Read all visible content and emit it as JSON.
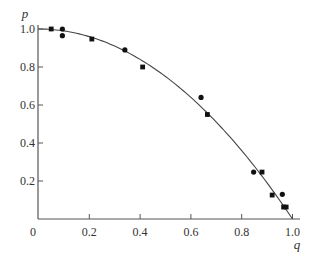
{
  "chart_data": {
    "type": "scatter",
    "title": "",
    "xlabel": "q",
    "ylabel": "p",
    "xlim": [
      0,
      1.0
    ],
    "ylim": [
      0,
      1.0
    ],
    "grid": false,
    "legend": null,
    "x_ticks": [
      {
        "value": 0,
        "label": "0"
      },
      {
        "value": 0.2,
        "label": "0.2"
      },
      {
        "value": 0.4,
        "label": "0.4"
      },
      {
        "value": 0.6,
        "label": "0.6"
      },
      {
        "value": 0.8,
        "label": "0.8"
      },
      {
        "value": 1.0,
        "label": "1.0"
      }
    ],
    "y_ticks": [
      {
        "value": 0.2,
        "label": "0.2"
      },
      {
        "value": 0.4,
        "label": "0.4"
      },
      {
        "value": 0.6,
        "label": "0.6"
      },
      {
        "value": 0.8,
        "label": "0.8"
      },
      {
        "value": 1.0,
        "label": "1.0"
      }
    ],
    "series": [
      {
        "name": "circles",
        "marker": "circle",
        "points": [
          {
            "x": 0.094,
            "y": 1.0
          },
          {
            "x": 0.094,
            "y": 0.965
          },
          {
            "x": 0.34,
            "y": 0.89
          },
          {
            "x": 0.64,
            "y": 0.64
          },
          {
            "x": 0.847,
            "y": 0.247
          },
          {
            "x": 0.96,
            "y": 0.13
          }
        ]
      },
      {
        "name": "squares",
        "marker": "square",
        "points": [
          {
            "x": 0.05,
            "y": 1.0
          },
          {
            "x": 0.21,
            "y": 0.947
          },
          {
            "x": 0.41,
            "y": 0.8
          },
          {
            "x": 0.665,
            "y": 0.55
          },
          {
            "x": 0.88,
            "y": 0.247
          },
          {
            "x": 0.92,
            "y": 0.126
          },
          {
            "x": 0.965,
            "y": 0.063
          },
          {
            "x": 0.975,
            "y": 0.063
          }
        ]
      },
      {
        "name": "fit curve",
        "type": "line",
        "equation": "p = 1 - q^2",
        "x": [
          0,
          0.1,
          0.2,
          0.3,
          0.4,
          0.5,
          0.6,
          0.7,
          0.8,
          0.9,
          1.0
        ],
        "y": [
          1.0,
          0.99,
          0.96,
          0.91,
          0.84,
          0.75,
          0.64,
          0.51,
          0.36,
          0.19,
          0.0
        ]
      }
    ]
  },
  "colors": {
    "marker": "#111111",
    "axis": "#555555",
    "curve": "#444444",
    "text": "#333333"
  }
}
